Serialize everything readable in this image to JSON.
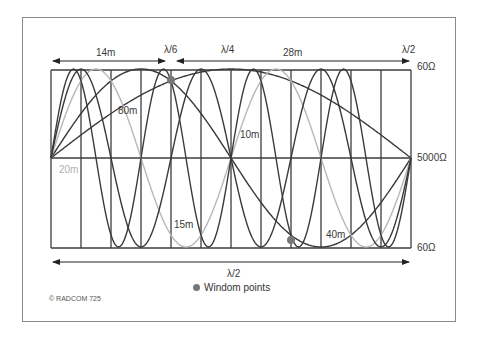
{
  "diagram": {
    "title_annotations": {
      "span_14m": "14m",
      "span_28m": "28m",
      "lambda_6": "λ/6",
      "lambda_4": "λ/4",
      "lambda_2_top": "λ/2",
      "lambda_2_bottom": "λ/2"
    },
    "impedance_labels": {
      "top": "60Ω",
      "middle": "5000Ω",
      "bottom": "60Ω"
    },
    "band_labels": {
      "b80": "80m",
      "b40": "40m",
      "b20": "20m",
      "b15": "15m",
      "b10": "10m"
    },
    "legend": {
      "windom_points": "Windom points"
    },
    "copyright": "© RADCOM 725",
    "colors": {
      "grid": "#3c3c3c",
      "curve_dark": "#3a3a3a",
      "curve_light": "#b8b8b8",
      "windom_dot": "#777777",
      "frame": "#8a8a8a"
    },
    "grid": {
      "x_start": 51,
      "x_end": 411,
      "columns": 12,
      "y_top": 70,
      "y_mid": 158,
      "y_bottom": 248
    },
    "curves": [
      {
        "band": "80m",
        "half_waves": 1,
        "color": "dark"
      },
      {
        "band": "40m",
        "half_waves": 2,
        "color": "dark"
      },
      {
        "band": "20m",
        "half_waves": 4,
        "color": "light"
      },
      {
        "band": "15m",
        "half_waves": 6,
        "color": "dark"
      },
      {
        "band": "10m",
        "half_waves": 8,
        "color": "dark"
      }
    ],
    "windom_points": [
      {
        "x": 171,
        "y": 80
      },
      {
        "x": 291,
        "y": 240
      }
    ]
  }
}
